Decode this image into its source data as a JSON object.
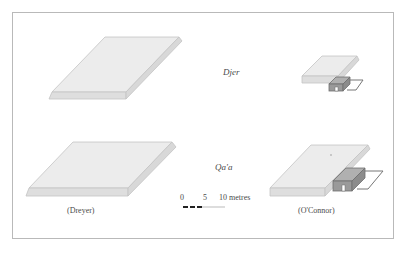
{
  "diagram": {
    "rows": [
      {
        "name": "Djer",
        "label": "Djer"
      },
      {
        "name": "Qa'a",
        "label": "Qa'a"
      }
    ],
    "columns": [
      {
        "source": "(Dreyer)",
        "label": "(Dreyer)"
      },
      {
        "source": "(O'Connor)",
        "label": "(O'Connor)"
      }
    ],
    "scale": {
      "ticks": [
        "0",
        "5",
        "10 metres"
      ],
      "unit": "metres"
    },
    "colors": {
      "frame": "#b9b9b9",
      "slab_top": "#ececec",
      "slab_edge": "#dcdcdc",
      "slab_outline": "#bdbdbd",
      "annex_fill": "#9a9a9a",
      "annex_outline": "#777777",
      "scale_bar": "#222222"
    }
  }
}
